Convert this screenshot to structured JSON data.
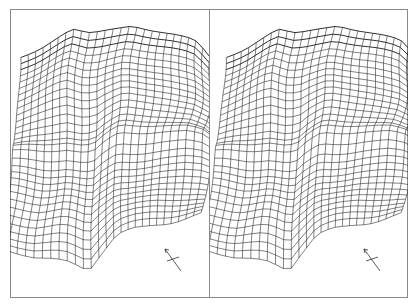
{
  "figure": {
    "type": "stereo-pair",
    "colors": {
      "mesh": "#1a1a1a",
      "frame": "#8a8a8a",
      "background": "#ffffff"
    },
    "panels": [
      {
        "id": "left",
        "x": 10,
        "width": 199,
        "view_shift": 0,
        "north_arrow": {
          "x": 173,
          "y": 259,
          "label": "N"
        }
      },
      {
        "id": "right",
        "x": 210,
        "width": 198,
        "view_shift": 7,
        "north_arrow": {
          "x": 372,
          "y": 259,
          "label": "N"
        }
      }
    ],
    "mesh": {
      "rows": 30,
      "cols": 26,
      "top_edge": [
        [
          0,
          47
        ],
        [
          20,
          38
        ],
        [
          52,
          18
        ],
        [
          70,
          22
        ],
        [
          110,
          15
        ],
        [
          150,
          25
        ],
        [
          175,
          32
        ],
        [
          190,
          45
        ],
        [
          199,
          62
        ]
      ],
      "bottom_edge": [
        [
          0,
          235
        ],
        [
          30,
          245
        ],
        [
          60,
          250
        ],
        [
          82,
          258
        ],
        [
          95,
          240
        ],
        [
          110,
          225
        ],
        [
          140,
          222
        ],
        [
          165,
          215
        ],
        [
          199,
          205
        ]
      ],
      "ridge_row": 0.52
    }
  }
}
